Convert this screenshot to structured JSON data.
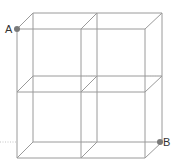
{
  "diagram": {
    "colors": {
      "edge": "#9a9a9a",
      "hidden_edge": "#c4c4c4",
      "point": "#7a7a7a",
      "label": "#333333"
    },
    "points": [
      {
        "id": "A",
        "label": "A",
        "x": 17,
        "y": 29,
        "label_x": 5,
        "label_y": 33
      },
      {
        "id": "B",
        "label": "B",
        "x": 160,
        "y": 142,
        "label_x": 163,
        "label_y": 146
      }
    ],
    "front_face": {
      "x_lines": [
        17,
        81,
        145
      ],
      "y_lines": [
        29,
        92,
        158
      ]
    },
    "back_face": {
      "x_lines": [
        33,
        97,
        162
      ],
      "y_lines": [
        13,
        76,
        142
      ]
    }
  }
}
